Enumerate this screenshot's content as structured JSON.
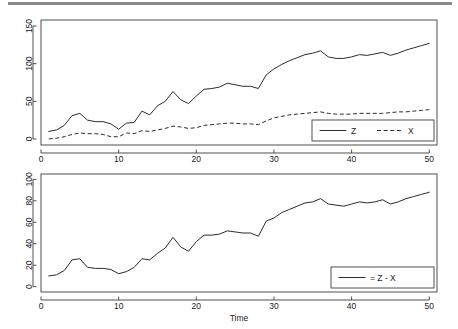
{
  "chart_data": [
    {
      "id": "top",
      "type": "line",
      "title": "",
      "xlabel": "",
      "ylabel": "",
      "xlim": [
        0,
        51
      ],
      "ylim": [
        -8,
        158
      ],
      "xticks": [
        0,
        10,
        20,
        30,
        40,
        50
      ],
      "yticks": [
        0,
        50,
        100,
        150
      ],
      "grid": false,
      "legend_position": "bottom-right",
      "x": [
        1,
        2,
        3,
        4,
        5,
        6,
        7,
        8,
        9,
        10,
        11,
        12,
        13,
        14,
        15,
        16,
        17,
        18,
        19,
        20,
        21,
        22,
        23,
        24,
        25,
        26,
        27,
        28,
        29,
        30,
        31,
        32,
        33,
        34,
        35,
        36,
        37,
        38,
        39,
        40,
        41,
        42,
        43,
        44,
        45,
        46,
        47,
        48,
        49,
        50
      ],
      "series": [
        {
          "name": "Z",
          "style": "solid",
          "values": [
            10,
            12,
            18,
            31,
            34,
            25,
            23,
            23,
            20,
            13,
            21,
            22,
            37,
            32,
            44,
            50,
            63,
            52,
            47,
            57,
            66,
            67,
            69,
            74,
            72,
            70,
            70,
            67,
            85,
            93,
            99,
            104,
            108,
            112,
            114,
            117,
            109,
            107,
            107,
            109,
            112,
            111,
            113,
            115,
            111,
            114,
            118,
            121,
            124,
            127
          ]
        },
        {
          "name": "X",
          "style": "dashed",
          "values": [
            0,
            1,
            3,
            6,
            8,
            7,
            7,
            6,
            3,
            3,
            8,
            7,
            11,
            10,
            12,
            14,
            17,
            16,
            14,
            15,
            18,
            19,
            20,
            21,
            21,
            20,
            20,
            19,
            24,
            28,
            30,
            32,
            33,
            34,
            35,
            36,
            34,
            33,
            33,
            33,
            34,
            34,
            34,
            34,
            35,
            36,
            36,
            37,
            38,
            39
          ]
        }
      ]
    },
    {
      "id": "bottom",
      "type": "line",
      "title": "",
      "xlabel": "Time",
      "ylabel": "",
      "xlim": [
        0,
        51
      ],
      "ylim": [
        -5,
        105
      ],
      "xticks": [
        0,
        10,
        20,
        30,
        40,
        50
      ],
      "yticks": [
        0,
        20,
        40,
        60,
        80,
        100
      ],
      "grid": false,
      "legend_position": "bottom-right",
      "x": [
        1,
        2,
        3,
        4,
        5,
        6,
        7,
        8,
        9,
        10,
        11,
        12,
        13,
        14,
        15,
        16,
        17,
        18,
        19,
        20,
        21,
        22,
        23,
        24,
        25,
        26,
        27,
        28,
        29,
        30,
        31,
        32,
        33,
        34,
        35,
        36,
        37,
        38,
        39,
        40,
        41,
        42,
        43,
        44,
        45,
        46,
        47,
        48,
        49,
        50
      ],
      "series": [
        {
          "name": "= Z - X",
          "style": "solid",
          "values": [
            10,
            11,
            15,
            25,
            26,
            18,
            17,
            17,
            16,
            12,
            14,
            18,
            26,
            25,
            31,
            36,
            46,
            37,
            33,
            42,
            48,
            48,
            49,
            52,
            51,
            50,
            50,
            47,
            61,
            64,
            69,
            72,
            75,
            78,
            79,
            82,
            77,
            76,
            75,
            77,
            79,
            78,
            79,
            81,
            77,
            79,
            82,
            84,
            86,
            88
          ]
        }
      ]
    }
  ],
  "legends": {
    "top": [
      {
        "label": "Z",
        "style": "solid"
      },
      {
        "label": "X",
        "style": "dashed"
      }
    ],
    "bottom": [
      {
        "label": "= Z - X",
        "style": "solid"
      }
    ]
  },
  "axis_titles": {
    "bottom_x": "Time"
  }
}
